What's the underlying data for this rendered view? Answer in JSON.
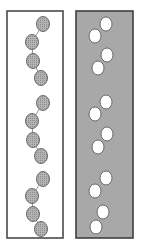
{
  "figure": {
    "type": "diagram",
    "width": 143,
    "height": 252,
    "background_color": "#ffffff"
  },
  "colors": {
    "page_background": "#ffffff",
    "panel_border": "#4a4a4a",
    "left_panel_fill": "#ffffff",
    "right_panel_fill": "#a8a8a8",
    "gray_node_fill": "#b0b0b0",
    "gray_node_stipple": "#8e8e8e",
    "gray_node_stroke": "#5c5c5c",
    "white_node_fill": "#ffffff",
    "white_node_stroke": "#5c5c5c",
    "connector_line": "#8a8a8a"
  },
  "panels": [
    {
      "name": "left-panel",
      "label": "Panel A",
      "fill": "#ffffff",
      "node_style": "gray-stippled",
      "connectors_visible": true,
      "x": 7,
      "y": 11,
      "width": 56,
      "height": 227,
      "chains": [
        {
          "name": "chain-1",
          "nodes": [
            {
              "cx": 43,
              "cy": 24,
              "rx": 6.5,
              "ry": 7.5
            },
            {
              "cx": 32,
              "cy": 42,
              "rx": 6.5,
              "ry": 7.5
            },
            {
              "cx": 33,
              "cy": 61,
              "rx": 6.5,
              "ry": 7.5
            },
            {
              "cx": 41,
              "cy": 78,
              "rx": 6.5,
              "ry": 7.5
            }
          ]
        },
        {
          "name": "chain-2",
          "nodes": [
            {
              "cx": 43,
              "cy": 103,
              "rx": 6.5,
              "ry": 7.5
            },
            {
              "cx": 32,
              "cy": 121,
              "rx": 6.5,
              "ry": 7.5
            },
            {
              "cx": 33,
              "cy": 140,
              "rx": 6.5,
              "ry": 7.5
            },
            {
              "cx": 41,
              "cy": 156,
              "rx": 6.5,
              "ry": 7.5
            }
          ]
        },
        {
          "name": "chain-3",
          "nodes": [
            {
              "cx": 43,
              "cy": 179,
              "rx": 6.5,
              "ry": 7.5
            },
            {
              "cx": 32,
              "cy": 196,
              "rx": 6.5,
              "ry": 7.5
            },
            {
              "cx": 33,
              "cy": 214,
              "rx": 6.5,
              "ry": 7.5
            },
            {
              "cx": 41,
              "cy": 229,
              "rx": 6.5,
              "ry": 7.5
            }
          ]
        }
      ]
    },
    {
      "name": "right-panel",
      "label": "Panel B",
      "fill": "#a8a8a8",
      "node_style": "white-open",
      "connectors_visible": false,
      "x": 76,
      "y": 11,
      "width": 57,
      "height": 227,
      "chains": [
        {
          "name": "chain-1",
          "nodes": [
            {
              "cx": 106,
              "cy": 24,
              "rx": 6.0,
              "ry": 7.0
            },
            {
              "cx": 95,
              "cy": 36,
              "rx": 6.0,
              "ry": 7.0
            },
            {
              "cx": 107,
              "cy": 55,
              "rx": 6.0,
              "ry": 7.0
            },
            {
              "cx": 98,
              "cy": 68,
              "rx": 6.0,
              "ry": 7.0
            }
          ]
        },
        {
          "name": "chain-2",
          "nodes": [
            {
              "cx": 106,
              "cy": 102,
              "rx": 6.0,
              "ry": 7.0
            },
            {
              "cx": 95,
              "cy": 114,
              "rx": 6.0,
              "ry": 7.0
            },
            {
              "cx": 107,
              "cy": 134,
              "rx": 6.0,
              "ry": 7.0
            },
            {
              "cx": 98,
              "cy": 147,
              "rx": 6.0,
              "ry": 7.0
            }
          ]
        },
        {
          "name": "chain-3",
          "nodes": [
            {
              "cx": 106,
              "cy": 178,
              "rx": 6.0,
              "ry": 7.0
            },
            {
              "cx": 95,
              "cy": 191,
              "rx": 6.0,
              "ry": 7.0
            },
            {
              "cx": 103,
              "cy": 212,
              "rx": 6.0,
              "ry": 7.0
            },
            {
              "cx": 96,
              "cy": 227,
              "rx": 6.0,
              "ry": 7.0
            }
          ]
        }
      ]
    }
  ]
}
